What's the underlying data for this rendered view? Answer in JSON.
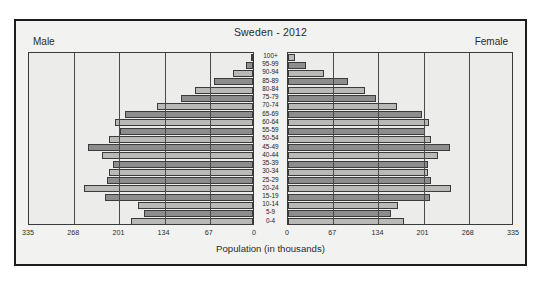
{
  "chart": {
    "title": "Sweden - 2012",
    "male_label": "Male",
    "female_label": "Female",
    "axis_title": "Population (in thousands)"
  },
  "chart_data": {
    "type": "bar",
    "subtype": "population-pyramid",
    "title": "Sweden - 2012",
    "xlabel": "Population (in thousands)",
    "ylabel": "",
    "xlim": [
      0,
      335
    ],
    "grid": true,
    "legend": "none",
    "left_axis_ticks": [
      "335",
      "268",
      "201",
      "134",
      "67",
      "0"
    ],
    "right_axis_ticks": [
      "0",
      "67",
      "134",
      "201",
      "268",
      "335"
    ],
    "tick_values": [
      335,
      268,
      201,
      134,
      67,
      0
    ],
    "categories": [
      "100+",
      "95-99",
      "90-94",
      "85-89",
      "80-84",
      "75-79",
      "70-74",
      "65-69",
      "60-64",
      "55-59",
      "50-54",
      "45-49",
      "40-44",
      "35-39",
      "30-34",
      "25-29",
      "20-24",
      "15-19",
      "10-14",
      "5-9",
      "0-4"
    ],
    "series": [
      {
        "name": "Male",
        "side": "left",
        "values": [
          3,
          11,
          30,
          58,
          86,
          107,
          143,
          190,
          205,
          197,
          213,
          244,
          224,
          208,
          213,
          216,
          250,
          219,
          170,
          161,
          181
        ]
      },
      {
        "name": "Female",
        "side": "right",
        "values": [
          10,
          26,
          54,
          89,
          114,
          130,
          161,
          199,
          209,
          203,
          212,
          240,
          223,
          207,
          207,
          212,
          242,
          211,
          163,
          153,
          172
        ]
      }
    ]
  }
}
